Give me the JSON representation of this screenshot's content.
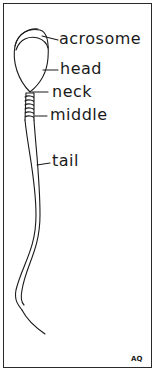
{
  "diagram": {
    "labels": [
      {
        "id": "acrosome",
        "text": "acrosome"
      },
      {
        "id": "head",
        "text": "head"
      },
      {
        "id": "neck",
        "text": "neck"
      },
      {
        "id": "middle",
        "text": "middle"
      },
      {
        "id": "tail",
        "text": "tail"
      }
    ],
    "signature": "AQ",
    "colors": {
      "line": "#1a1a1a",
      "background": "#ffffff"
    }
  }
}
